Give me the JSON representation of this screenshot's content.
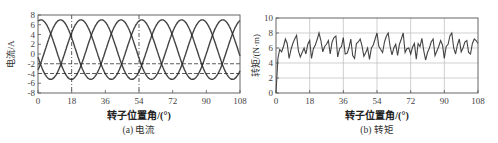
{
  "chart_data": [
    {
      "id": "a",
      "type": "line",
      "caption": "(a) 电流",
      "xlabel": "转子位置角/(°)",
      "ylabel": "电流/A",
      "xlim": [
        0,
        108
      ],
      "ylim": [
        -8,
        8
      ],
      "xticks": [
        0,
        18,
        36,
        54,
        72,
        90,
        108
      ],
      "yticks": [
        -8,
        -6,
        -4,
        -2,
        0,
        2,
        4,
        6,
        8
      ],
      "grid": false,
      "reference_lines": {
        "horizontal_dashed": [
          -2,
          -4
        ],
        "vertical_dashdot": [
          18,
          54
        ]
      },
      "series": [
        {
          "name": "phase A",
          "amplitude_peak": 7,
          "trough": -5.2,
          "period_deg": 32.4,
          "first_peak_deg": 12
        },
        {
          "name": "phase B",
          "amplitude_peak": 7,
          "trough": -5.2,
          "period_deg": 32.4,
          "first_peak_deg": 23
        },
        {
          "name": "phase C",
          "amplitude_peak": 7,
          "trough": -5.2,
          "period_deg": 32.4,
          "first_peak_deg": 34
        }
      ]
    },
    {
      "id": "b",
      "type": "line",
      "caption": "(b) 转矩",
      "xlabel": "转子位置角/(°)",
      "ylabel": "转矩/(N·m)",
      "xlim": [
        0,
        108
      ],
      "ylim": [
        0,
        10
      ],
      "xticks": [
        0,
        18,
        36,
        54,
        72,
        90,
        108
      ],
      "yticks": [
        0,
        2,
        4,
        6,
        8,
        10
      ],
      "grid": true,
      "series": [
        {
          "name": "torque",
          "x": [
            0,
            1,
            2,
            3,
            4,
            5,
            6,
            7,
            8,
            9,
            10,
            11,
            12,
            13,
            14,
            15,
            16,
            17,
            18,
            19,
            20,
            21,
            22,
            23,
            24,
            25,
            26,
            27,
            28,
            29,
            30,
            31,
            32,
            33,
            34,
            35,
            36,
            37,
            38,
            39,
            40,
            41,
            42,
            43,
            44,
            45,
            46,
            47,
            48,
            49,
            50,
            51,
            52,
            53,
            54,
            55,
            56,
            57,
            58,
            59,
            60,
            61,
            62,
            63,
            64,
            65,
            66,
            67,
            68,
            69,
            70,
            71,
            72,
            73,
            74,
            75,
            76,
            77,
            78,
            79,
            80,
            81,
            82,
            83,
            84,
            85,
            86,
            87,
            88,
            89,
            90,
            91,
            92,
            93,
            94,
            95,
            96,
            97,
            98,
            99,
            100,
            101,
            102,
            103,
            104,
            105,
            106,
            107,
            108
          ],
          "values": [
            0,
            4.6,
            5.8,
            5.5,
            6.2,
            7.2,
            6.6,
            4.6,
            5.8,
            6.6,
            7.2,
            7.7,
            5.6,
            4.8,
            5.4,
            6.0,
            5.2,
            6.5,
            7.0,
            4.6,
            5.9,
            6.4,
            7.1,
            8.0,
            7.0,
            5.5,
            6.2,
            6.5,
            7.0,
            5.2,
            6.8,
            7.4,
            7.6,
            4.8,
            5.9,
            6.2,
            7.4,
            5.2,
            5.3,
            6.0,
            7.2,
            5.0,
            4.6,
            6.6,
            6.8,
            7.2,
            6.3,
            4.9,
            5.4,
            6.0,
            4.5,
            6.0,
            6.4,
            7.2,
            8.0,
            6.2,
            5.8,
            5.4,
            6.8,
            7.6,
            8.0,
            6.2,
            5.1,
            6.0,
            6.5,
            5.0,
            6.5,
            7.2,
            8.0,
            5.4,
            5.9,
            6.0,
            5.2,
            6.1,
            6.6,
            4.5,
            6.6,
            6.2,
            7.3,
            5.6,
            4.4,
            5.4,
            6.0,
            6.8,
            7.2,
            5.0,
            5.6,
            6.2,
            7.0,
            6.4,
            4.6,
            6.2,
            6.5,
            7.6,
            8.0,
            6.0,
            5.2,
            6.4,
            7.2,
            5.5,
            6.0,
            6.8,
            7.0,
            5.4,
            5.2,
            6.6,
            7.2,
            7.0,
            6.6
          ]
        }
      ]
    }
  ]
}
